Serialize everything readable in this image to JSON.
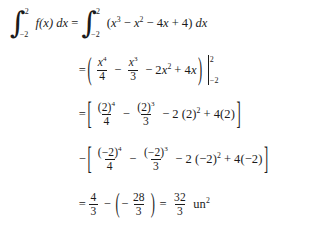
{
  "document": {
    "type": "math-worksheet",
    "title": "Definite integral evaluation",
    "background_color": "#ffffff",
    "text_color": "#1b1b1b"
  },
  "math": {
    "lines": [
      {
        "id": "line-1",
        "description": "original definite integral equated to expanded polynomial integral",
        "lead": "",
        "lhs_integral": {
          "symbol": "∫",
          "lower_limit": "−2",
          "upper_limit": "2",
          "integrand": "f(x)",
          "differential": "dx"
        },
        "relation": "=",
        "rhs_integral": {
          "symbol": "∫",
          "lower_limit": "−2",
          "upper_limit": "2",
          "integrand": "(x³ − x² − 4x + 4)",
          "differential": "dx"
        }
      },
      {
        "id": "line-2",
        "description": "antiderivative in parentheses with evaluation bar",
        "lead": "=",
        "terms": [
          "x⁴/4",
          "− x³/3",
          "− 2x²",
          "+ 4x"
        ],
        "eval_upper": "2",
        "eval_lower": "−2"
      },
      {
        "id": "line-3",
        "description": "upper limit substitution bracket",
        "lead": "=",
        "terms": [
          "(2)⁴/4",
          "− (2)³/3",
          "− 2 (2)²",
          "+ 4(2)"
        ]
      },
      {
        "id": "line-4",
        "description": "lower limit substitution bracket subtracted",
        "lead": "−",
        "terms": [
          "(−2)⁴/4",
          "− (−2)³/3",
          "− 2 (−2)²",
          "+ 4(−2)"
        ]
      },
      {
        "id": "line-5",
        "description": "final arithmetic and result",
        "lead": "=",
        "first_fraction": {
          "num": "4",
          "den": "3"
        },
        "operator": "−",
        "second_fraction": {
          "num": "28",
          "den": "3",
          "sign": "−"
        },
        "relation": "=",
        "result_fraction": {
          "num": "32",
          "den": "3"
        },
        "units": "un",
        "units_exponent": "2"
      }
    ],
    "symbols": {
      "integral": "∫",
      "minus": "−",
      "plus": "+",
      "equals": "=",
      "left_paren": "(",
      "right_paren": ")",
      "left_bracket": "[",
      "right_bracket": "]",
      "variable": "x",
      "function": "f",
      "differential": "dx"
    },
    "values": {
      "lower_bound": "−2",
      "upper_bound": "2",
      "coefficients": [
        "1",
        "−1",
        "−4",
        "4"
      ],
      "upper_eval_value": "4/3",
      "lower_eval_value": "−28/3",
      "answer": "32/3",
      "answer_units": "un²"
    }
  }
}
